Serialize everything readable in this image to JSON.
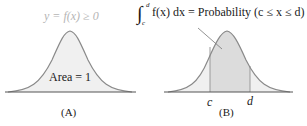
{
  "panel_a": {
    "curve_label": "y = f(x) ≥ 0",
    "area_label": "Area = 1",
    "caption": "(A)"
  },
  "panel_b": {
    "integral_lower": "c",
    "integral_upper": "d",
    "integral_body": "f(x) dx = Probability (c ≤ x ≤ d)",
    "c_label": "c",
    "d_label": "d",
    "caption": "(B)"
  },
  "colors": {
    "curve": "#8a8a8a",
    "fill_light": "#f0f0f0",
    "fill_dark": "#dcdcdc",
    "axis": "#555555",
    "curve_label": "#b5b5b5",
    "text": "#1a1a1a"
  }
}
